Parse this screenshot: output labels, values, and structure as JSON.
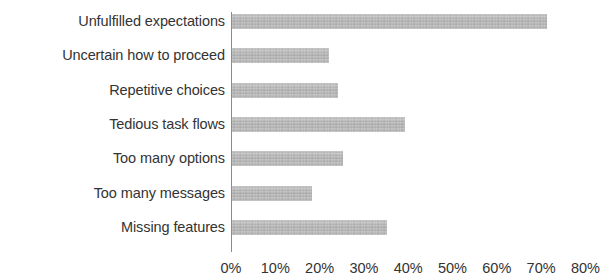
{
  "chart_data": {
    "type": "bar",
    "orientation": "horizontal",
    "title": "",
    "xlabel": "",
    "ylabel": "",
    "categories": [
      "Unfulfilled expectations",
      "Uncertain how to proceed",
      "Repetitive choices",
      "Tedious task flows",
      "Too many options",
      "Too many messages",
      "Missing features"
    ],
    "values": [
      71,
      22,
      24,
      39,
      25,
      18,
      35
    ],
    "value_unit": "%",
    "xlim": [
      0,
      80
    ],
    "xticks": [
      0,
      10,
      20,
      30,
      40,
      50,
      60,
      70,
      80
    ],
    "xtick_labels": [
      "0%",
      "10%",
      "20%",
      "30%",
      "40%",
      "50%",
      "60%",
      "70%",
      "80%"
    ],
    "grid": false,
    "legend": null,
    "bar_color": "#b4b4b4",
    "axis_color": "#8c8c8c",
    "text_color": "#333333",
    "background_color": "#ffffff"
  }
}
